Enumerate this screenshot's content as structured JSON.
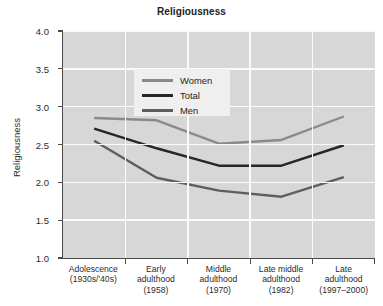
{
  "chart_data": {
    "type": "line",
    "title": "Religiousness",
    "xlabel": "",
    "ylabel": "Religiousness",
    "ylim": [
      1.0,
      4.0
    ],
    "yticks": [
      "1.0",
      "1.5",
      "2.0",
      "2.5",
      "3.0",
      "3.5",
      "4.0"
    ],
    "grid": true,
    "legend_position": "upper-left",
    "categories": [
      "Adolescence (1930s/'40s)",
      "Early adulthood (1958)",
      "Middle adulthood (1970)",
      "Late middle adulthood (1982)",
      "Late adulthood (1997–2000)"
    ],
    "category_lines": [
      [
        "Adolescence",
        "(1930s/'40s)"
      ],
      [
        "Early",
        "adulthood",
        "(1958)"
      ],
      [
        "Middle",
        "adulthood",
        "(1970)"
      ],
      [
        "Late middle",
        "adulthood",
        "(1982)"
      ],
      [
        "Late",
        "adulthood",
        "(1997–2000)"
      ]
    ],
    "series": [
      {
        "name": "Women",
        "color": "#8a8a8a",
        "values": [
          2.85,
          2.82,
          2.51,
          2.56,
          2.87
        ]
      },
      {
        "name": "Total",
        "color": "#262626",
        "values": [
          2.71,
          2.45,
          2.22,
          2.22,
          2.49
        ]
      },
      {
        "name": "Men",
        "color": "#5e5e5e",
        "values": [
          2.55,
          2.06,
          1.89,
          1.81,
          2.07
        ]
      }
    ]
  },
  "legend": {
    "items": [
      {
        "label": "Women"
      },
      {
        "label": "Total"
      },
      {
        "label": "Men"
      }
    ]
  }
}
